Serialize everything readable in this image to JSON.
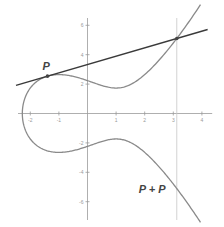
{
  "diagram": {
    "curve": {
      "equation": "y^2 = x^3 - 3x + 5",
      "a": -3,
      "b": 5,
      "x_max": 3.95
    },
    "axes": {
      "x_range": [
        -2.5,
        4.5
      ],
      "y_range": [
        -7.5,
        7.5
      ],
      "x_ticks": [
        -2,
        -1,
        1,
        2,
        3,
        4
      ],
      "y_ticks": [
        6,
        4,
        2,
        -2,
        -4,
        -6
      ],
      "x_tick_labels": [
        "-2",
        "-1",
        "1",
        "2",
        "3",
        "4"
      ],
      "y_tick_labels": [
        "6",
        "4",
        "2",
        "-2",
        "-4",
        "-6"
      ]
    },
    "point_p": {
      "x": -1.4,
      "label": "P"
    },
    "tangent_x_range": [
      -2.5,
      4.2
    ],
    "result_label": "P + P",
    "colors": {
      "curve": "#8a8a8a",
      "tangent": "#3a3a3a",
      "axis": "#9a9a9a",
      "guide": "#c8c8c8",
      "point": "#444444"
    }
  }
}
